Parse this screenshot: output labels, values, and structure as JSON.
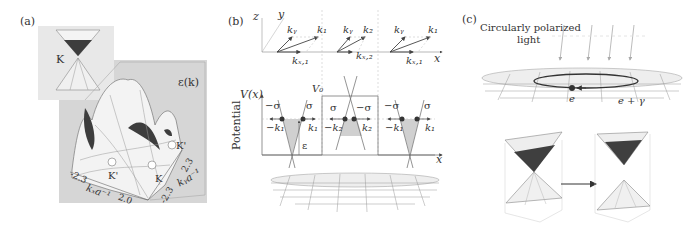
{
  "figure": {
    "panels": [
      {
        "id": "a",
        "label": "(a)",
        "inset_label": "K",
        "surface_label": "ε(k)",
        "valley_labels": [
          "K'",
          "K'",
          "K"
        ],
        "axis_x_label": "kₓa⁻¹",
        "axis_y_label": "kᵧa⁻¹",
        "axis_x_ticks": [
          "-2.3",
          "2.0"
        ],
        "axis_y_ticks": [
          "2.3",
          "-2.3"
        ]
      },
      {
        "id": "b",
        "label": "(b)",
        "axes3d": {
          "z": "z",
          "y": "y",
          "x": "x"
        },
        "vectors": [
          {
            "ky": "kᵧ",
            "k": "k₁",
            "kx": "kₓ,₁"
          },
          {
            "ky": "kᵧ",
            "k": "k₂",
            "kx": "kₓ,₂"
          },
          {
            "ky": "kᵧ",
            "k": "k₁",
            "kx": "kₓ,₁"
          }
        ],
        "potential_axis_label": "V(x)",
        "potential_ylabel": "Potential",
        "barrier_label": "V₀",
        "energy_label": "ε",
        "x_label": "x",
        "regions": [
          {
            "sigma_left": "−σ",
            "sigma_right": "σ",
            "k_left": "−k₁",
            "k_right": "k₁"
          },
          {
            "sigma_left": "σ",
            "sigma_right": "−σ",
            "k_left": "−k₂",
            "k_right": "k₂"
          },
          {
            "sigma_left": "−σ",
            "sigma_right": "σ",
            "k_left": "−k₁",
            "k_right": "k₁"
          }
        ]
      },
      {
        "id": "c",
        "label": "(c)",
        "light_label_line1": "Circularly polarized",
        "light_label_line2": "light",
        "electron_label": "e",
        "dressed_label": "e + γ"
      }
    ],
    "colors": {
      "panel_bg": "#d9d9d9",
      "inset_bg": "#e6e6e6",
      "surface_light": "#f2f2f2",
      "surface_dark": "#555555",
      "line": "#555555",
      "shade": "#cfcfcf"
    }
  }
}
